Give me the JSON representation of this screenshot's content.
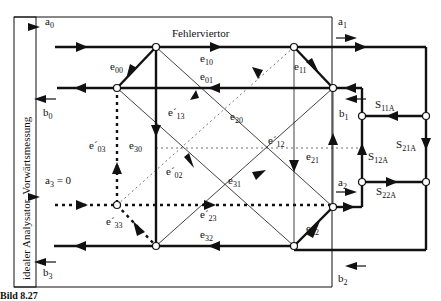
{
  "diagram": {
    "title": "Fehlerviertor",
    "side_label": "idealer Analysator, Vorwärtsmessung",
    "caption": "Bild 8.27",
    "ports": {
      "a0": {
        "base": "a",
        "sub": "0"
      },
      "b0": {
        "base": "b",
        "sub": "0"
      },
      "a1": {
        "base": "a",
        "sub": "1"
      },
      "b1": {
        "base": "b",
        "sub": "1"
      },
      "a2": {
        "base": "a",
        "sub": "2"
      },
      "b2": {
        "base": "b",
        "sub": "2"
      },
      "a3": {
        "base": "a",
        "sub": "3",
        "suffix": " = 0"
      },
      "b3": {
        "base": "b",
        "sub": "3"
      }
    },
    "error_terms": {
      "e00": {
        "base": "e",
        "sub": "00"
      },
      "e10": {
        "base": "e",
        "sub": "10"
      },
      "e01": {
        "base": "e",
        "sub": "01"
      },
      "e11": {
        "base": "e",
        "sub": "11"
      },
      "e13p": {
        "base": "e´",
        "sub": "13"
      },
      "e20": {
        "base": "e",
        "sub": "20"
      },
      "e12p": {
        "base": "e´",
        "sub": "12"
      },
      "e03p": {
        "base": "e´",
        "sub": "03"
      },
      "e30": {
        "base": "e",
        "sub": "30"
      },
      "e02p": {
        "base": "e´",
        "sub": "02"
      },
      "e21": {
        "base": "e",
        "sub": "21"
      },
      "e31": {
        "base": "e",
        "sub": "31"
      },
      "e23p": {
        "base": "e´",
        "sub": "23"
      },
      "e33p": {
        "base": "e´",
        "sub": "33"
      },
      "e32": {
        "base": "e",
        "sub": "32"
      },
      "e22": {
        "base": "e",
        "sub": "22"
      }
    },
    "dut_terms": {
      "S11A": {
        "base": "S",
        "sub": "11A"
      },
      "S21A": {
        "base": "S",
        "sub": "21A"
      },
      "S12A": {
        "base": "S",
        "sub": "12A"
      },
      "S22A": {
        "base": "S",
        "sub": "22A"
      }
    }
  }
}
